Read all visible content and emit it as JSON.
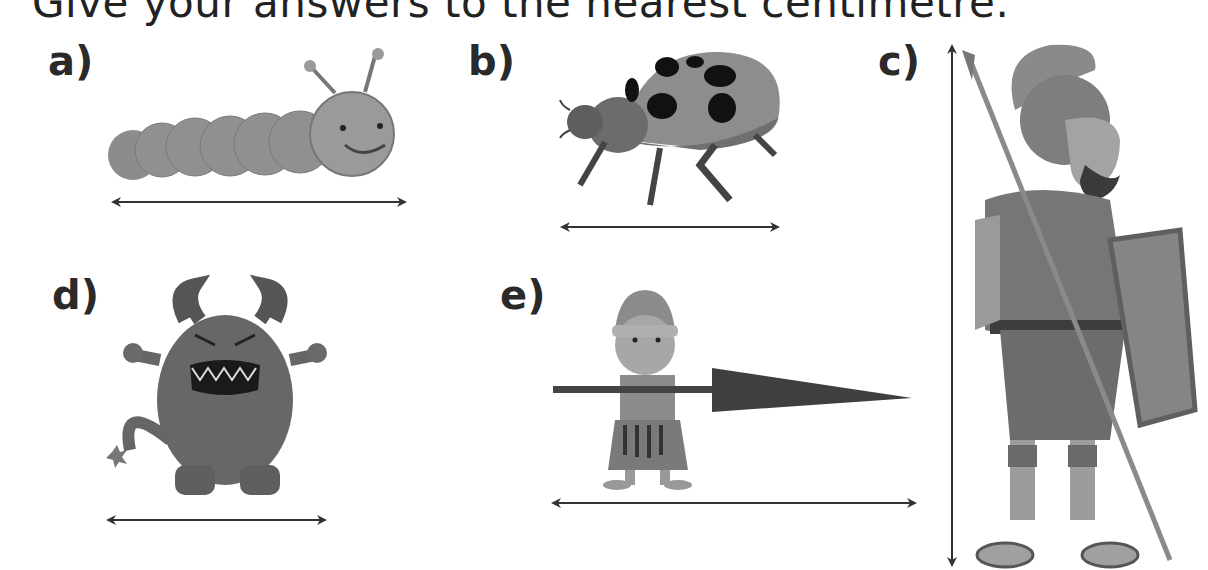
{
  "instruction": "Give your answers to the nearest centimetre.",
  "items": [
    {
      "label": "a)",
      "subject": "caterpillar",
      "measure": "horizontal"
    },
    {
      "label": "b)",
      "subject": "ladybird",
      "measure": "horizontal"
    },
    {
      "label": "c)",
      "subject": "roman-soldier",
      "measure": "vertical"
    },
    {
      "label": "d)",
      "subject": "monster",
      "measure": "horizontal"
    },
    {
      "label": "e)",
      "subject": "boy-with-spear",
      "measure": "horizontal"
    }
  ],
  "colors": {
    "ink": "#2a2a2a",
    "arrow": "#333333",
    "figure_mid": "#8a8a8a",
    "figure_dark": "#5a5a5a"
  }
}
